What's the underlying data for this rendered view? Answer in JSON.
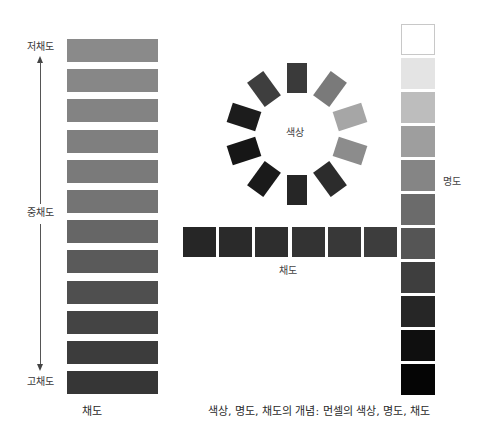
{
  "chroma_scale": {
    "labels": {
      "low": "저채도",
      "mid": "중채도",
      "high": "고채도"
    },
    "caption": "채도",
    "bars": [
      {
        "color": "#8a8a8a"
      },
      {
        "color": "#878787"
      },
      {
        "color": "#838383"
      },
      {
        "color": "#7f7f7f"
      },
      {
        "color": "#7a7a7a"
      },
      {
        "color": "#747474"
      },
      {
        "color": "#666666"
      },
      {
        "color": "#5a5a5a"
      },
      {
        "color": "#4f4f4f"
      },
      {
        "color": "#444444"
      },
      {
        "color": "#3c3c3c"
      },
      {
        "color": "#363636"
      }
    ]
  },
  "hue_wheel": {
    "label": "색상",
    "center": [
      297,
      134
    ],
    "radius": 56,
    "swatches": [
      {
        "angle": 0,
        "color": "#3a3a3a"
      },
      {
        "angle": 36,
        "color": "#7a7a7a"
      },
      {
        "angle": 72,
        "color": "#a6a6a6"
      },
      {
        "angle": 108,
        "color": "#8c8c8c"
      },
      {
        "angle": 144,
        "color": "#2c2c2c"
      },
      {
        "angle": 180,
        "color": "#262626"
      },
      {
        "angle": 216,
        "color": "#1a1a1a"
      },
      {
        "angle": 252,
        "color": "#161616"
      },
      {
        "angle": 288,
        "color": "#1c1c1c"
      },
      {
        "angle": 324,
        "color": "#3e3e3e"
      }
    ]
  },
  "chroma_row": {
    "caption": "채도",
    "swatches": [
      {
        "color": "#262626"
      },
      {
        "color": "#2a2a2a"
      },
      {
        "color": "#2e2e2e"
      },
      {
        "color": "#333333"
      },
      {
        "color": "#383838"
      },
      {
        "color": "#3d3d3d"
      }
    ]
  },
  "value_scale": {
    "label": "명도",
    "swatches": [
      {
        "color": "#ffffff",
        "border": "#c8c8c8"
      },
      {
        "color": "#e4e4e4",
        "border": "#e4e4e4"
      },
      {
        "color": "#bdbdbd",
        "border": "#bdbdbd"
      },
      {
        "color": "#9e9e9e",
        "border": "#9e9e9e"
      },
      {
        "color": "#858585",
        "border": "#858585"
      },
      {
        "color": "#6b6b6b",
        "border": "#6b6b6b"
      },
      {
        "color": "#555555",
        "border": "#555555"
      },
      {
        "color": "#3e3e3e",
        "border": "#3e3e3e"
      },
      {
        "color": "#262626",
        "border": "#262626"
      },
      {
        "color": "#0f0f0f",
        "border": "#0f0f0f"
      },
      {
        "color": "#050505",
        "border": "#050505"
      }
    ]
  },
  "figure_captions": {
    "left": "채도",
    "right": "색상, 명도, 채도의 개념: 먼셀의 색상, 명도, 채도"
  }
}
